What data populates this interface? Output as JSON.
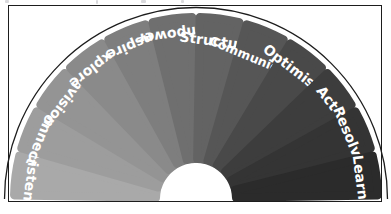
{
  "diagram": {
    "type": "semicircular-fan",
    "title": "",
    "frame_color": "#1d1d1d",
    "background": "#ffffff",
    "label_color": "#ffffff",
    "center": {
      "x": 196,
      "y": 199
    },
    "inner_radius": 36,
    "outer_radius": 186,
    "arc_start_deg": 180,
    "arc_end_deg": 0,
    "segment_count": 12,
    "segments": [
      {
        "label": "Listen",
        "color": "#a9a9a9",
        "order": 1
      },
      {
        "label": "Connect",
        "color": "#9d9d9d",
        "order": 2
      },
      {
        "label": "Envision",
        "color": "#949494",
        "order": 3
      },
      {
        "label": "Explore",
        "color": "#8a8a8a",
        "order": 4
      },
      {
        "label": "Inspire",
        "color": "#7e7e7e",
        "order": 5
      },
      {
        "label": "Empower",
        "color": "#6f6f6f",
        "order": 6
      },
      {
        "label": "Structure",
        "color": "#636363",
        "order": 7
      },
      {
        "label": "Communicate",
        "color": "#565656",
        "order": 8
      },
      {
        "label": "Optimism",
        "color": "#494949",
        "order": 9
      },
      {
        "label": "Act",
        "color": "#3d3d3d",
        "order": 10
      },
      {
        "label": "Resolve",
        "color": "#343434",
        "order": 11
      },
      {
        "label": "Learn",
        "color": "#2b2b2b",
        "order": 12
      }
    ]
  },
  "artifacts": {
    "top_edge_note": "faint clipped glyph remnants along the very top edge"
  }
}
